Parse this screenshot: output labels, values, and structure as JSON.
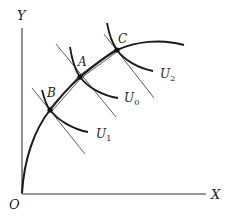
{
  "diagram": {
    "type": "economics-production-possibility-with-indifference-curves",
    "axes": {
      "x_label": "X",
      "y_label": "Y",
      "origin_label": "O"
    },
    "points": [
      {
        "id": "B",
        "label": "B"
      },
      {
        "id": "A",
        "label": "A"
      },
      {
        "id": "C",
        "label": "C"
      }
    ],
    "indifference_curves": [
      {
        "id": "U1",
        "label": "U",
        "subscript": "1",
        "through": "B"
      },
      {
        "id": "U0",
        "label": "U",
        "subscript": "0",
        "through": "A"
      },
      {
        "id": "U2",
        "label": "U",
        "subscript": "2",
        "through": "C"
      }
    ],
    "colors": {
      "line": "#1a1a1a",
      "background": "#ffffff"
    }
  }
}
